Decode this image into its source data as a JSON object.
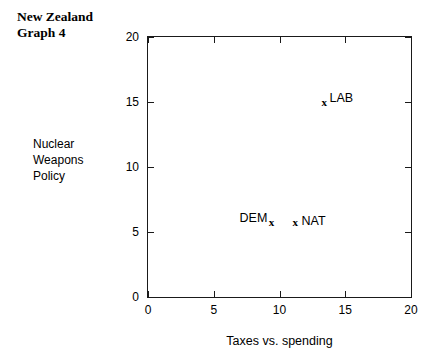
{
  "title": {
    "line1": "New Zealand",
    "line2": "Graph 4"
  },
  "ylabel_lines": {
    "line1": "Nuclear",
    "line2": "Weapons",
    "line3": "Policy"
  },
  "chart_data": {
    "type": "scatter",
    "title": "New Zealand Graph 4",
    "xlabel": "Taxes vs. spending",
    "ylabel": "Nuclear Weapons Policy",
    "xlim": [
      0,
      20
    ],
    "ylim": [
      0,
      20
    ],
    "xticks": [
      0,
      5,
      10,
      15,
      20
    ],
    "yticks": [
      0,
      5,
      10,
      15,
      20
    ],
    "xtick_labels": [
      "0",
      "5",
      "10",
      "15",
      "20"
    ],
    "ytick_labels": [
      "0",
      "5",
      "10",
      "15",
      "20"
    ],
    "grid": false,
    "legend": false,
    "marker": "x",
    "points": [
      {
        "label": "LAB",
        "x": 13.4,
        "y": 15.0,
        "label_position": "upper-right"
      },
      {
        "label": "DEM",
        "x": 9.4,
        "y": 5.8,
        "label_position": "upper-left"
      },
      {
        "label": "NAT",
        "x": 11.2,
        "y": 5.8,
        "label_position": "right"
      }
    ]
  }
}
